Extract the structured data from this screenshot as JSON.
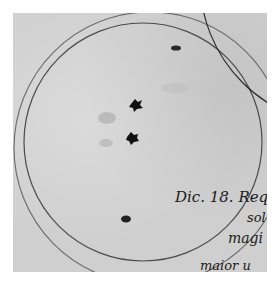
{
  "figure": {
    "colors": {
      "paper": "#cfcfcf",
      "ink": "#2a2a2a",
      "background": "#ffffff"
    },
    "annotation_lines": [
      "Dic. 18. Req",
      "sol",
      "magi",
      "maior u"
    ],
    "spots": [
      {
        "label": "spot-top-right",
        "cx": 176,
        "cy": 48
      },
      {
        "label": "spot-center-upper",
        "cx": 136,
        "cy": 105
      },
      {
        "label": "spot-center-lower",
        "cx": 132,
        "cy": 137
      },
      {
        "label": "spot-bottom",
        "cx": 126,
        "cy": 219
      }
    ]
  }
}
